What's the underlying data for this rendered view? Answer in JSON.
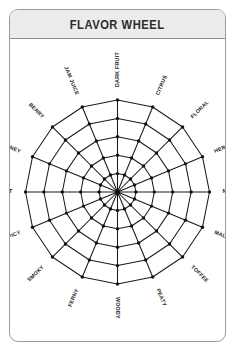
{
  "card": {
    "title": "FLAVOR WHEEL"
  },
  "chart_data": {
    "type": "radar",
    "title": "FLAVOR WHEEL",
    "categories": [
      "DARK FRUIT",
      "CITRUS",
      "FLORAL",
      "HERBAL",
      "NUTTY",
      "MALTY",
      "TOFFEE",
      "PEATY",
      "WOODY",
      "FERNY",
      "SMOKY",
      "SPICY",
      "SWEET",
      "WINEY",
      "BERRY",
      "JAM JUICE"
    ],
    "values": [
      5,
      5,
      5,
      5,
      5,
      5,
      5,
      5,
      5,
      5,
      5,
      5,
      5,
      5,
      5,
      5
    ],
    "rings": 5,
    "spokes": 16,
    "grid": true,
    "legend": false,
    "ylim": [
      0,
      5
    ],
    "colors": {
      "grid_line": "#1a1a1a",
      "point": "#111111",
      "label": "#1a1a1a",
      "header_bg": "#ececec",
      "card_border": "#9a9a9a",
      "background": "#ffffff"
    }
  }
}
